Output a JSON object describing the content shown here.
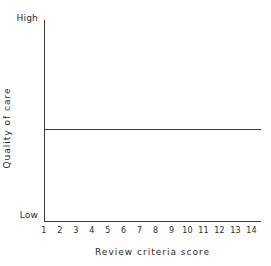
{
  "chart_data": {
    "type": "line",
    "title": "",
    "xlabel": "Review criteria score",
    "ylabel": "Quality of care",
    "x": [
      1,
      2,
      3,
      4,
      5,
      6,
      7,
      8,
      9,
      10,
      11,
      12,
      13,
      14
    ],
    "xticklabels": [
      "1",
      "2",
      "3",
      "4",
      "5",
      "6",
      "7",
      "8",
      "9",
      "10",
      "11",
      "12",
      "13",
      "14"
    ],
    "xlim": [
      1,
      14.6
    ],
    "ylim": [
      0,
      1
    ],
    "yticklabels": [
      "Low",
      "High"
    ],
    "y_axis_top_label": "High",
    "y_axis_bottom_label": "Low",
    "grid": false,
    "legend": null,
    "series": [
      {
        "name": "Quality of care",
        "values": [
          0.46,
          0.46,
          0.46,
          0.46,
          0.46,
          0.46,
          0.46,
          0.46,
          0.46,
          0.46,
          0.46,
          0.46,
          0.46,
          0.46
        ]
      }
    ],
    "annotations": [],
    "colors": {
      "axis": "#3a3a3a",
      "series": "#3a3a3a",
      "text": "#2b2b2b",
      "background": "#ffffff"
    }
  }
}
